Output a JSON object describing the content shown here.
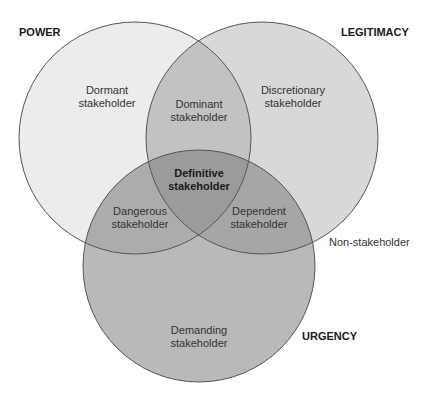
{
  "sets": {
    "power": {
      "label": "POWER",
      "cx": 135,
      "cy": 138,
      "r": 116,
      "fill": "#ececec"
    },
    "legitimacy": {
      "label": "LEGITIMACY",
      "cx": 262,
      "cy": 138,
      "r": 116,
      "fill": "#d8d8d8"
    },
    "urgency": {
      "label": "URGENCY",
      "cx": 199,
      "cy": 266,
      "r": 116,
      "fill": "#b9b9b9"
    }
  },
  "regions": {
    "dormant": {
      "line1": "Dormant",
      "line2": "stakeholder"
    },
    "discretionary": {
      "line1": "Discretionary",
      "line2": "stakeholder"
    },
    "dominant": {
      "line1": "Dominant",
      "line2": "stakeholder"
    },
    "definitive": {
      "line1": "Definitive",
      "line2": "stakeholder"
    },
    "dangerous": {
      "line1": "Dangerous",
      "line2": "stakeholder"
    },
    "dependent": {
      "line1": "Dependent",
      "line2": "stakeholder"
    },
    "demanding": {
      "line1": "Demanding",
      "line2": "stakeholder"
    }
  },
  "outside": {
    "label": "Non-stakeholder"
  },
  "colors": {
    "stroke": "#555555",
    "overlap_two": "#a9a9a9",
    "overlap_three": "#9a9a9a"
  }
}
